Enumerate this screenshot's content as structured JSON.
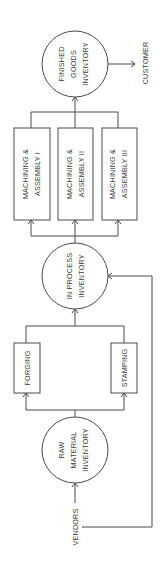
{
  "diagram": {
    "orientation": "rotated-90-ccw",
    "colors": {
      "line": "#4a4a4a",
      "text": "#3a3a3a",
      "background": "#ffffff"
    },
    "nodes": {
      "vendors": {
        "label": "VENDORS"
      },
      "raw_material": {
        "line1": "RAW",
        "line2": "MATERIAL",
        "line3": "INVENTORY"
      },
      "forging": {
        "label": "FORGING"
      },
      "stamping": {
        "label": "STAMPING"
      },
      "in_process": {
        "line1": "IN PROCESS",
        "line2": "INVENTORY"
      },
      "ma1": {
        "line1": "MACHINING &",
        "line2": "ASSEMBLY I"
      },
      "ma2": {
        "line1": "MACHINING &",
        "line2": "ASSEMBLY II"
      },
      "ma3": {
        "line1": "MACHINING &",
        "line2": "ASSEMBLY III"
      },
      "finished": {
        "line1": "FINISHED",
        "line2": "GOODS",
        "line3": "INVENTORY"
      },
      "customer": {
        "label": "CUSTOMER"
      }
    },
    "edges": [
      [
        "VENDORS",
        "RAW MATERIAL INVENTORY"
      ],
      [
        "RAW MATERIAL INVENTORY",
        "FORGING"
      ],
      [
        "RAW MATERIAL INVENTORY",
        "STAMPING"
      ],
      [
        "FORGING",
        "IN PROCESS INVENTORY"
      ],
      [
        "STAMPING",
        "IN PROCESS INVENTORY"
      ],
      [
        "VENDORS",
        "IN PROCESS INVENTORY"
      ],
      [
        "IN PROCESS INVENTORY",
        "MACHINING & ASSEMBLY I"
      ],
      [
        "IN PROCESS INVENTORY",
        "MACHINING & ASSEMBLY II"
      ],
      [
        "IN PROCESS INVENTORY",
        "MACHINING & ASSEMBLY III"
      ],
      [
        "MACHINING & ASSEMBLY I",
        "FINISHED GOODS INVENTORY"
      ],
      [
        "MACHINING & ASSEMBLY II",
        "FINISHED GOODS INVENTORY"
      ],
      [
        "MACHINING & ASSEMBLY III",
        "FINISHED GOODS INVENTORY"
      ],
      [
        "FINISHED GOODS INVENTORY",
        "CUSTOMER"
      ]
    ]
  }
}
